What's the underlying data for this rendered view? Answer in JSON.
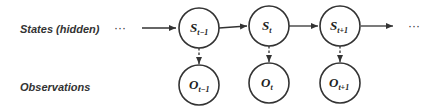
{
  "rows": {
    "states_label": "States (hidden)",
    "observations_label": "Observations"
  },
  "ellipsis": {
    "left": "···",
    "right": "···"
  },
  "states": [
    {
      "symbol": "S",
      "subscript": "t−1"
    },
    {
      "symbol": "S",
      "subscript": "t"
    },
    {
      "symbol": "S",
      "subscript": "t+1"
    }
  ],
  "observations": [
    {
      "symbol": "O",
      "subscript": "t−1"
    },
    {
      "symbol": "O",
      "subscript": "t"
    },
    {
      "symbol": "O",
      "subscript": "t+1"
    }
  ],
  "edges": {
    "transition_style": "solid",
    "emission_style": "dashed"
  }
}
